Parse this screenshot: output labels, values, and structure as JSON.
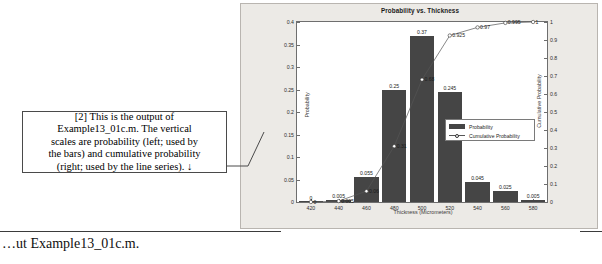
{
  "callout": {
    "text": "[2] This is the output of\nExample13_01c.m.  The vertical\nscales are probability (left; used by\nthe bars) and cumulative probability\n(right; used by the line series).  ↓"
  },
  "clipped_line": {
    "text": "…ut Example13_01c.m."
  },
  "figure": {
    "title": "Probability vs. Thickness"
  },
  "legend": {
    "bar_label": "Probability",
    "line_label": "Cumulative Probability"
  },
  "chart_data": {
    "type": "bar",
    "title": "Probability vs. Thickness",
    "xlabel": "Thickness (Micrometers)",
    "ylabel": "Probability",
    "y2label": "Cumulative Probability",
    "categories": [
      420,
      440,
      460,
      480,
      500,
      520,
      540,
      560,
      580
    ],
    "values": [
      0,
      0.005,
      0.055,
      0.25,
      0.37,
      0.245,
      0.045,
      0.025,
      0.005
    ],
    "value_labels": [
      "0",
      "0.005",
      "0.055",
      "0.25",
      "0.37",
      "0.245",
      "0.045",
      "0.025",
      "0.005"
    ],
    "ylim": [
      0,
      0.4
    ],
    "yticks": [
      "0",
      "0.05",
      "0.1",
      "0.15",
      "0.2",
      "0.25",
      "0.3",
      "0.35",
      "0.4"
    ],
    "ytickvals": [
      0,
      0.05,
      0.1,
      0.15,
      0.2,
      0.25,
      0.3,
      0.35,
      0.4
    ],
    "xticks": [
      "420",
      "440",
      "460",
      "480",
      "500",
      "520",
      "540",
      "560",
      "580"
    ],
    "xlim": [
      410,
      590
    ],
    "grid": false,
    "legend_position": "center-right",
    "series": [
      {
        "name": "Probability",
        "type": "bar",
        "values": [
          0,
          0.005,
          0.055,
          0.25,
          0.37,
          0.245,
          0.045,
          0.025,
          0.005
        ]
      },
      {
        "name": "Cumulative Probability",
        "type": "line",
        "axis": "right",
        "y2lim": [
          0,
          1
        ],
        "y2ticks": [
          "0",
          "0.1",
          "0.2",
          "0.3",
          "0.4",
          "0.5",
          "0.6",
          "0.7",
          "0.8",
          "0.9",
          "1"
        ],
        "values": [
          0,
          0.005,
          0.06,
          0.31,
          0.68,
          0.925,
          0.97,
          0.995,
          1
        ],
        "value_labels": [
          "0",
          "0.005",
          "0.06",
          "0.31",
          "0.68",
          "0.925",
          "0.97",
          "0.995",
          "1"
        ]
      }
    ]
  }
}
